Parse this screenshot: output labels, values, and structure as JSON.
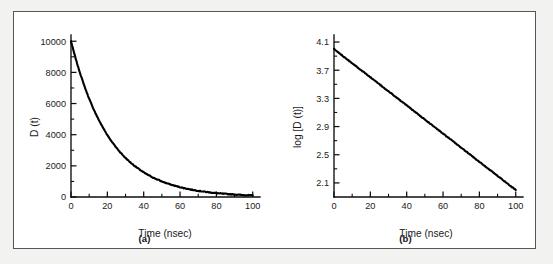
{
  "figure": {
    "background_color": "#ffffff",
    "border_color": "#55555a",
    "page_color": "#f2f2f0",
    "curve_color": "#000000"
  },
  "panels": [
    {
      "id": "a",
      "caption": "(a)",
      "xlabel": "Time (nsec)",
      "ylabel": "D (t)",
      "xticks": [
        "0",
        "20",
        "40",
        "60",
        "80",
        "100"
      ],
      "yticks": [
        "0",
        "2000",
        "4000",
        "6000",
        "8000",
        "10000"
      ]
    },
    {
      "id": "b",
      "caption": "(b)",
      "xlabel": "Time (nsec)",
      "ylabel": "log [D (t)]",
      "xticks": [
        "0",
        "20",
        "40",
        "60",
        "80",
        "100"
      ],
      "yticks": [
        "2.1",
        "2.5",
        "2.9",
        "3.3",
        "3.7",
        "4.1"
      ]
    }
  ],
  "chart_data": [
    {
      "type": "line",
      "panel": "a",
      "title": "",
      "xlabel": "Time (nsec)",
      "ylabel": "D (t)",
      "xlim": [
        0,
        104
      ],
      "ylim": [
        0,
        10400
      ],
      "xticks": [
        0,
        20,
        40,
        60,
        80,
        100
      ],
      "yticks": [
        0,
        2000,
        4000,
        6000,
        8000,
        10000
      ],
      "xminor_step": 10,
      "yminor_step": 1000,
      "grid": false,
      "legend": null,
      "x": [
        0,
        2,
        4,
        6,
        8,
        10,
        12,
        14,
        16,
        18,
        20,
        22,
        24,
        26,
        28,
        30,
        32,
        34,
        36,
        38,
        40,
        42,
        44,
        46,
        48,
        50,
        52,
        54,
        56,
        58,
        60,
        62,
        64,
        66,
        68,
        70,
        72,
        74,
        76,
        78,
        80,
        82,
        84,
        86,
        88,
        90,
        92,
        94,
        96,
        98,
        100
      ],
      "values": [
        10000,
        9120,
        8320,
        7590,
        6920,
        6310,
        5750,
        5250,
        4790,
        4370,
        3980,
        3630,
        3310,
        3020,
        2750,
        2510,
        2290,
        2090,
        1910,
        1740,
        1580,
        1440,
        1320,
        1200,
        1100,
        1000,
        912,
        832,
        759,
        692,
        631,
        575,
        525,
        479,
        437,
        398,
        363,
        331,
        302,
        275,
        251,
        229,
        209,
        191,
        174,
        158,
        144,
        132,
        120,
        110,
        100
      ],
      "note": "Exponential decay D(t) = 10000 * 10^(-t/50)"
    },
    {
      "type": "line",
      "panel": "b",
      "title": "",
      "xlabel": "Time (nsec)",
      "ylabel": "log [D (t)]",
      "xlim": [
        0,
        104
      ],
      "ylim": [
        1.9,
        4.2
      ],
      "xticks": [
        0,
        20,
        40,
        60,
        80,
        100
      ],
      "yticks": [
        2.1,
        2.5,
        2.9,
        3.3,
        3.7,
        4.1
      ],
      "xminor_step": 10,
      "yminor_step": 0.2,
      "grid": false,
      "legend": null,
      "x": [
        0,
        2,
        4,
        6,
        8,
        10,
        12,
        14,
        16,
        18,
        20,
        22,
        24,
        26,
        28,
        30,
        32,
        34,
        36,
        38,
        40,
        42,
        44,
        46,
        48,
        50,
        52,
        54,
        56,
        58,
        60,
        62,
        64,
        66,
        68,
        70,
        72,
        74,
        76,
        78,
        80,
        82,
        84,
        86,
        88,
        90,
        92,
        94,
        96,
        98,
        100
      ],
      "values": [
        4.0,
        3.96,
        3.92,
        3.88,
        3.84,
        3.8,
        3.76,
        3.72,
        3.68,
        3.64,
        3.6,
        3.56,
        3.52,
        3.48,
        3.44,
        3.4,
        3.36,
        3.32,
        3.28,
        3.24,
        3.2,
        3.16,
        3.12,
        3.08,
        3.04,
        3.0,
        2.96,
        2.92,
        2.88,
        2.84,
        2.8,
        2.76,
        2.72,
        2.68,
        2.64,
        2.6,
        2.56,
        2.52,
        2.48,
        2.44,
        2.4,
        2.36,
        2.32,
        2.28,
        2.24,
        2.2,
        2.16,
        2.12,
        2.08,
        2.04,
        2.0
      ],
      "note": "Linear: log10 D(t) = 4.0 - t/50"
    }
  ]
}
